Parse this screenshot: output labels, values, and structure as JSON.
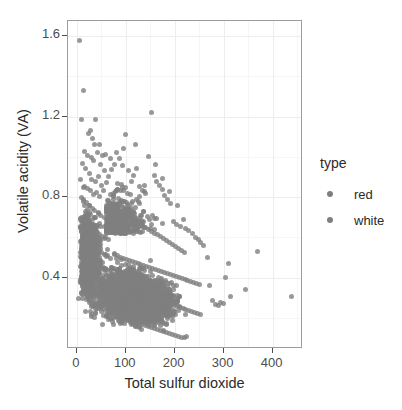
{
  "chart_data": {
    "type": "scatter",
    "title": "",
    "xlabel": "Total sulfur dioxide",
    "ylabel": "Volatile acidity (VA)",
    "xlim": [
      -18,
      462
    ],
    "ylim": [
      0.045,
      1.675
    ],
    "xticks": [
      0,
      100,
      200,
      300,
      400
    ],
    "xtick_labels": [
      "0",
      "100",
      "200",
      "300",
      "400"
    ],
    "yticks": [
      0.4,
      0.8,
      1.2,
      1.6
    ],
    "ytick_labels": [
      "0.4",
      "0.8",
      "1.2",
      "1.6"
    ],
    "grid": true,
    "legend_position": "right",
    "legend": {
      "title": "type",
      "entries": [
        {
          "label": "red",
          "color": "#7f7f7f"
        },
        {
          "label": "white",
          "color": "#7f7f7f"
        }
      ]
    },
    "point_color": "#7f7f7f",
    "point_opacity": 0.8,
    "point_size_px": 5,
    "series": [
      {
        "name": "red",
        "color": "#7f7f7f",
        "points": [
          [
            6,
            1.58
          ],
          [
            13,
            1.33
          ],
          [
            10,
            1.185
          ],
          [
            27,
            1.13
          ],
          [
            24,
            1.115
          ],
          [
            33,
            1.09
          ],
          [
            39,
            1.185
          ],
          [
            16,
            1.025
          ],
          [
            21,
            1.005
          ],
          [
            29,
            0.995
          ],
          [
            35,
            0.98
          ],
          [
            43,
            1.02
          ],
          [
            48,
            0.96
          ],
          [
            52,
            1.005
          ],
          [
            57,
            0.93
          ],
          [
            12,
            0.965
          ],
          [
            18,
            0.94
          ],
          [
            25,
            0.915
          ],
          [
            31,
            0.885
          ],
          [
            38,
            0.875
          ],
          [
            45,
            0.9
          ],
          [
            50,
            0.86
          ],
          [
            8,
            0.885
          ],
          [
            15,
            0.855
          ],
          [
            22,
            0.845
          ],
          [
            28,
            0.835
          ],
          [
            34,
            0.815
          ],
          [
            41,
            0.825
          ],
          [
            47,
            0.805
          ],
          [
            54,
            0.835
          ],
          [
            60,
            0.87
          ],
          [
            65,
            0.9
          ],
          [
            70,
            0.935
          ],
          [
            76,
            0.96
          ],
          [
            82,
            1.02
          ],
          [
            88,
            0.99
          ],
          [
            93,
            0.955
          ],
          [
            99,
            1.11
          ],
          [
            105,
            0.93
          ],
          [
            111,
            0.875
          ],
          [
            9,
            0.8
          ],
          [
            14,
            0.79
          ],
          [
            19,
            0.775
          ],
          [
            26,
            0.76
          ],
          [
            32,
            0.745
          ],
          [
            37,
            0.735
          ],
          [
            44,
            0.72
          ],
          [
            49,
            0.71
          ],
          [
            56,
            0.7
          ],
          [
            62,
            0.69
          ],
          [
            11,
            0.68
          ],
          [
            17,
            0.67
          ],
          [
            23,
            0.655
          ],
          [
            30,
            0.645
          ],
          [
            36,
            0.635
          ],
          [
            42,
            0.625
          ],
          [
            46,
            0.615
          ],
          [
            53,
            0.605
          ],
          [
            59,
            0.6
          ],
          [
            64,
            0.59
          ],
          [
            7,
            0.58
          ],
          [
            13,
            0.57
          ],
          [
            20,
            0.565
          ],
          [
            27,
            0.555
          ],
          [
            33,
            0.545
          ],
          [
            40,
            0.54
          ],
          [
            45,
            0.53
          ],
          [
            51,
            0.525
          ],
          [
            58,
            0.515
          ],
          [
            63,
            0.51
          ],
          [
            10,
            0.5
          ],
          [
            16,
            0.495
          ],
          [
            24,
            0.485
          ],
          [
            29,
            0.48
          ],
          [
            35,
            0.47
          ],
          [
            43,
            0.465
          ],
          [
            48,
            0.455
          ],
          [
            55,
            0.45
          ],
          [
            61,
            0.44
          ],
          [
            66,
            0.435
          ],
          [
            12,
            0.43
          ],
          [
            18,
            0.42
          ],
          [
            25,
            0.415
          ],
          [
            31,
            0.405
          ],
          [
            38,
            0.4
          ],
          [
            44,
            0.395
          ],
          [
            50,
            0.385
          ],
          [
            57,
            0.38
          ],
          [
            62,
            0.37
          ],
          [
            68,
            0.365
          ],
          [
            15,
            0.36
          ],
          [
            21,
            0.35
          ],
          [
            28,
            0.345
          ],
          [
            34,
            0.335
          ],
          [
            41,
            0.33
          ],
          [
            47,
            0.32
          ],
          [
            53,
            0.315
          ],
          [
            60,
            0.305
          ],
          [
            65,
            0.3
          ],
          [
            71,
            0.295
          ]
        ]
      },
      {
        "name": "white",
        "color": "#7f7f7f",
        "points": [
          [
            115,
            0.905
          ],
          [
            122,
            0.94
          ],
          [
            128,
            0.855
          ],
          [
            134,
            0.835
          ],
          [
            140,
            0.82
          ],
          [
            146,
            1.0
          ],
          [
            152,
            1.22
          ],
          [
            158,
            0.905
          ],
          [
            163,
            0.875
          ],
          [
            169,
            0.86
          ],
          [
            174,
            0.84
          ],
          [
            180,
            0.81
          ],
          [
            186,
            0.79
          ],
          [
            192,
            0.77
          ],
          [
            198,
            0.68
          ],
          [
            204,
            0.665
          ],
          [
            211,
            0.655
          ],
          [
            217,
            0.69
          ],
          [
            223,
            0.645
          ],
          [
            229,
            0.635
          ],
          [
            236,
            0.62
          ],
          [
            242,
            0.6
          ],
          [
            248,
            0.59
          ],
          [
            253,
            0.575
          ],
          [
            259,
            0.56
          ],
          [
            74,
            0.77
          ],
          [
            80,
            0.755
          ],
          [
            86,
            0.745
          ],
          [
            92,
            0.73
          ],
          [
            98,
            0.72
          ],
          [
            104,
            0.71
          ],
          [
            110,
            0.7
          ],
          [
            116,
            0.69
          ],
          [
            123,
            0.68
          ],
          [
            129,
            0.67
          ],
          [
            135,
            0.66
          ],
          [
            141,
            0.65
          ],
          [
            147,
            0.64
          ],
          [
            153,
            0.63
          ],
          [
            159,
            0.62
          ],
          [
            165,
            0.615
          ],
          [
            171,
            0.605
          ],
          [
            177,
            0.595
          ],
          [
            183,
            0.585
          ],
          [
            189,
            0.575
          ],
          [
            195,
            0.565
          ],
          [
            201,
            0.555
          ],
          [
            207,
            0.545
          ],
          [
            213,
            0.535
          ],
          [
            219,
            0.525
          ],
          [
            77,
            0.515
          ],
          [
            83,
            0.51
          ],
          [
            89,
            0.5
          ],
          [
            95,
            0.495
          ],
          [
            101,
            0.49
          ],
          [
            107,
            0.485
          ],
          [
            113,
            0.48
          ],
          [
            119,
            0.475
          ],
          [
            125,
            0.47
          ],
          [
            131,
            0.465
          ],
          [
            137,
            0.46
          ],
          [
            143,
            0.455
          ],
          [
            149,
            0.45
          ],
          [
            155,
            0.445
          ],
          [
            161,
            0.44
          ],
          [
            167,
            0.435
          ],
          [
            173,
            0.43
          ],
          [
            179,
            0.425
          ],
          [
            185,
            0.42
          ],
          [
            191,
            0.415
          ],
          [
            197,
            0.41
          ],
          [
            203,
            0.405
          ],
          [
            209,
            0.4
          ],
          [
            215,
            0.395
          ],
          [
            221,
            0.39
          ],
          [
            227,
            0.385
          ],
          [
            233,
            0.38
          ],
          [
            239,
            0.375
          ],
          [
            245,
            0.37
          ],
          [
            251,
            0.365
          ],
          [
            79,
            0.36
          ],
          [
            85,
            0.355
          ],
          [
            91,
            0.35
          ],
          [
            97,
            0.345
          ],
          [
            103,
            0.34
          ],
          [
            109,
            0.335
          ],
          [
            115,
            0.33
          ],
          [
            121,
            0.325
          ],
          [
            127,
            0.32
          ],
          [
            133,
            0.315
          ],
          [
            139,
            0.31
          ],
          [
            145,
            0.305
          ],
          [
            151,
            0.3
          ],
          [
            157,
            0.295
          ],
          [
            163,
            0.29
          ],
          [
            169,
            0.285
          ],
          [
            175,
            0.28
          ],
          [
            181,
            0.275
          ],
          [
            187,
            0.27
          ],
          [
            193,
            0.265
          ],
          [
            199,
            0.26
          ],
          [
            205,
            0.255
          ],
          [
            211,
            0.25
          ],
          [
            217,
            0.245
          ],
          [
            223,
            0.24
          ],
          [
            229,
            0.235
          ],
          [
            235,
            0.23
          ],
          [
            241,
            0.225
          ],
          [
            247,
            0.22
          ],
          [
            253,
            0.215
          ],
          [
            81,
            0.21
          ],
          [
            87,
            0.205
          ],
          [
            93,
            0.2
          ],
          [
            99,
            0.195
          ],
          [
            105,
            0.19
          ],
          [
            111,
            0.185
          ],
          [
            117,
            0.18
          ],
          [
            123,
            0.175
          ],
          [
            129,
            0.17
          ],
          [
            135,
            0.165
          ],
          [
            141,
            0.16
          ],
          [
            147,
            0.155
          ],
          [
            153,
            0.15
          ],
          [
            159,
            0.145
          ],
          [
            165,
            0.14
          ],
          [
            171,
            0.135
          ],
          [
            177,
            0.13
          ],
          [
            183,
            0.125
          ],
          [
            189,
            0.12
          ],
          [
            195,
            0.115
          ],
          [
            201,
            0.11
          ],
          [
            207,
            0.105
          ],
          [
            213,
            0.1
          ],
          [
            219,
            0.1
          ],
          [
            225,
            0.105
          ],
          [
            266,
            0.5
          ],
          [
            272,
            0.36
          ],
          [
            278,
            0.285
          ],
          [
            284,
            0.265
          ],
          [
            289,
            0.26
          ],
          [
            294,
            0.275
          ],
          [
            299,
            0.27
          ],
          [
            304,
            0.4
          ],
          [
            309,
            0.47
          ],
          [
            313,
            0.305
          ],
          [
            344,
            0.34
          ],
          [
            369,
            0.53
          ],
          [
            438,
            0.305
          ],
          [
            160,
            0.96
          ],
          [
            175,
            0.89
          ],
          [
            190,
            0.83
          ],
          [
            205,
            0.76
          ],
          [
            120,
            1.06
          ],
          [
            95,
            1.04
          ],
          [
            68,
            0.99
          ],
          [
            58,
            1.01
          ],
          [
            46,
            1.06
          ],
          [
            36,
            1.06
          ]
        ]
      }
    ]
  }
}
